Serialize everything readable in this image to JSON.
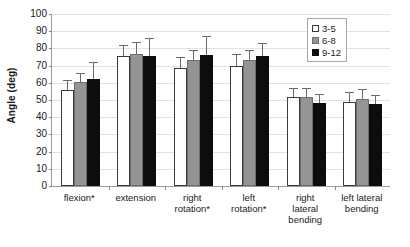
{
  "chart_data": {
    "type": "bar",
    "title": "",
    "xlabel": "",
    "ylabel": "Angle (deg)",
    "ylim": [
      0,
      100
    ],
    "ytick_step": 10,
    "yticks": [
      0,
      10,
      20,
      30,
      40,
      50,
      60,
      70,
      80,
      90,
      100
    ],
    "grid": true,
    "legend_position": "top-right",
    "categories": [
      "flexion*",
      "extension",
      "right rotation*",
      "left rotation*",
      "right lateral bending",
      "left lateral bending"
    ],
    "category_lines": [
      [
        "flexion*"
      ],
      [
        "extension"
      ],
      [
        "right",
        "rotation*"
      ],
      [
        "left",
        "rotation*"
      ],
      [
        "right",
        "lateral",
        "bending"
      ],
      [
        "left lateral",
        "bending"
      ]
    ],
    "series": [
      {
        "name": "3-5",
        "color": "#ffffff",
        "values": [
          56,
          75.5,
          68.5,
          69.5,
          51.5,
          49
        ],
        "errors": [
          5,
          6,
          6,
          6.5,
          5,
          5
        ]
      },
      {
        "name": "6-8",
        "color": "#949494",
        "values": [
          60.5,
          77,
          73.5,
          73,
          51.5,
          50.5
        ],
        "errors": [
          4.5,
          6,
          5,
          5.5,
          5,
          5.5
        ]
      },
      {
        "name": "9-12",
        "color": "#0d0d0d",
        "values": [
          62.5,
          75.5,
          76,
          75.5,
          48.5,
          47.5
        ],
        "errors": [
          9,
          10,
          10.5,
          7,
          4.5,
          5
        ]
      }
    ]
  },
  "legend": {
    "items": [
      {
        "label": "3-5",
        "swatch": "white-square-swatch"
      },
      {
        "label": "6-8",
        "swatch": "gray-square-swatch"
      },
      {
        "label": "9-12",
        "swatch": "black-square-swatch"
      }
    ]
  }
}
